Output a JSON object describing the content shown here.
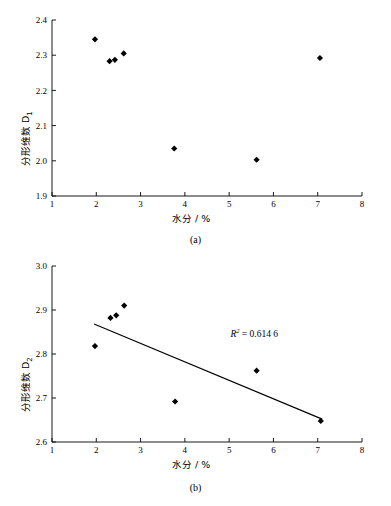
{
  "figure": {
    "background": "#ffffff",
    "axis_color": "#000000",
    "marker_color": "#000000",
    "line_color": "#000000"
  },
  "panels": [
    {
      "id": "a",
      "caption": "(a)",
      "chart": {
        "type": "scatter",
        "title": "",
        "xlabel": "水分 / %",
        "ylabel": "分形维数 D",
        "ylabel_sub": "1",
        "xlim": [
          1,
          8
        ],
        "ylim": [
          1.9,
          2.4
        ],
        "xticks": [
          "1",
          "2",
          "3",
          "4",
          "5",
          "6",
          "7",
          "8"
        ],
        "yticks": [
          "1.9",
          "2.0",
          "2.1",
          "2.2",
          "2.3",
          "2.4"
        ],
        "grid": false,
        "legend": null,
        "points": [
          {
            "x": 1.97,
            "y": 2.345
          },
          {
            "x": 2.3,
            "y": 2.283
          },
          {
            "x": 2.42,
            "y": 2.287
          },
          {
            "x": 2.62,
            "y": 2.305
          },
          {
            "x": 3.76,
            "y": 2.035
          },
          {
            "x": 5.62,
            "y": 2.003
          },
          {
            "x": 7.05,
            "y": 2.292
          }
        ],
        "trendline": null,
        "annotation": null
      }
    },
    {
      "id": "b",
      "caption": "(b)",
      "chart": {
        "type": "scatter",
        "title": "",
        "xlabel": "水分 / %",
        "ylabel": "分形维数 D",
        "ylabel_sub": "2",
        "xlim": [
          1,
          8
        ],
        "ylim": [
          2.6,
          3.0
        ],
        "xticks": [
          "1",
          "2",
          "3",
          "4",
          "5",
          "6",
          "7",
          "8"
        ],
        "yticks": [
          "2.6",
          "2.7",
          "2.8",
          "2.9",
          "3.0"
        ],
        "grid": false,
        "legend": null,
        "points": [
          {
            "x": 1.97,
            "y": 2.818
          },
          {
            "x": 2.32,
            "y": 2.882
          },
          {
            "x": 2.45,
            "y": 2.888
          },
          {
            "x": 2.63,
            "y": 2.91
          },
          {
            "x": 3.78,
            "y": 2.692
          },
          {
            "x": 5.62,
            "y": 2.762
          },
          {
            "x": 7.07,
            "y": 2.648
          }
        ],
        "trendline": {
          "x_start": 1.95,
          "y_start": 2.868,
          "x_end": 7.1,
          "y_end": 2.652
        },
        "annotation": {
          "text_prefix": "R",
          "text_sup": "2",
          "text_eq": " = 0.614 6",
          "x": 5.3,
          "y": 2.845
        }
      }
    }
  ]
}
